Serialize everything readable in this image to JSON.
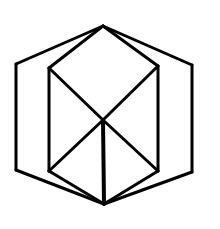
{
  "diagram": {
    "title": "Hexagon enclosing a cube wireframe",
    "stroke_color": "#000000",
    "background_color": "#ffffff",
    "vertices": {
      "top": [
        103,
        26
      ],
      "bottom": [
        104,
        204
      ],
      "center": [
        103,
        120
      ],
      "outer_left_top": [
        16,
        64
      ],
      "outer_left_bottom": [
        16,
        170
      ],
      "outer_right_top": [
        192,
        65
      ],
      "outer_right_bottom": [
        192,
        172
      ],
      "inner_left_top": [
        49,
        68
      ],
      "inner_left_bottom": [
        49,
        171
      ],
      "inner_right_top": [
        158,
        66
      ],
      "inner_right_bottom": [
        158,
        171
      ]
    },
    "edges": [
      {
        "name": "outer-top-left",
        "from": "top",
        "to": "outer_left_top"
      },
      {
        "name": "outer-left-side",
        "from": "outer_left_top",
        "to": "outer_left_bottom"
      },
      {
        "name": "outer-bottom-left",
        "from": "outer_left_bottom",
        "to": "bottom"
      },
      {
        "name": "outer-top-right",
        "from": "top",
        "to": "outer_right_top"
      },
      {
        "name": "outer-right-side",
        "from": "outer_right_top",
        "to": "outer_right_bottom"
      },
      {
        "name": "outer-bottom-right",
        "from": "outer_right_bottom",
        "to": "bottom"
      },
      {
        "name": "inner-top-left",
        "from": "top",
        "to": "inner_left_top"
      },
      {
        "name": "inner-top-right",
        "from": "top",
        "to": "inner_right_top"
      },
      {
        "name": "inner-left-side",
        "from": "inner_left_top",
        "to": "inner_left_bottom"
      },
      {
        "name": "inner-right-side",
        "from": "inner_right_top",
        "to": "inner_right_bottom"
      },
      {
        "name": "inner-bottom-left",
        "from": "inner_left_bottom",
        "to": "bottom"
      },
      {
        "name": "inner-bottom-right",
        "from": "inner_right_bottom",
        "to": "bottom"
      },
      {
        "name": "diag-left-top-to-center",
        "from": "inner_left_top",
        "to": "center"
      },
      {
        "name": "diag-right-top-to-center",
        "from": "inner_right_top",
        "to": "center"
      },
      {
        "name": "diag-center-to-left-bottom",
        "from": "center",
        "to": "inner_left_bottom"
      },
      {
        "name": "diag-center-to-right-bottom",
        "from": "center",
        "to": "inner_right_bottom"
      },
      {
        "name": "center-vertical",
        "from": "center",
        "to": "bottom"
      }
    ]
  }
}
